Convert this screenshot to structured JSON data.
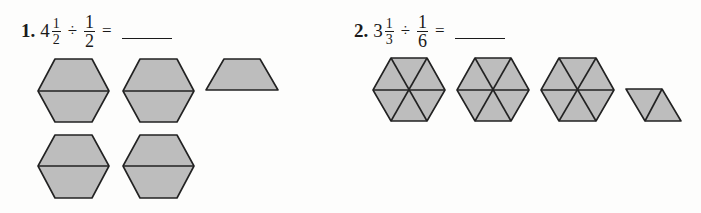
{
  "problems": [
    {
      "number": "1.",
      "whole": "4",
      "frac1_num": "1",
      "frac1_den": "2",
      "operator": "÷",
      "frac2_num": "1",
      "frac2_den": "2",
      "equals": "=",
      "answer": ""
    },
    {
      "number": "2.",
      "whole": "3",
      "frac1_num": "1",
      "frac1_den": "3",
      "operator": "÷",
      "frac2_num": "1",
      "frac2_den": "6",
      "equals": "=",
      "answer": ""
    }
  ],
  "figures": {
    "problem1": {
      "description": "Four hexagons each split into two trapezoids, plus one trapezoid",
      "hexagons_halved": 4,
      "extra_trapezoids": 1
    },
    "problem2": {
      "description": "Three hexagons each split into six triangles, plus one rhombus split into two triangles",
      "hexagons_sixths": 3,
      "extra_triangles": 2
    }
  },
  "colors": {
    "shape_fill": "#bdbdbd",
    "outline": "#222222",
    "background": "#fdfdfc"
  }
}
